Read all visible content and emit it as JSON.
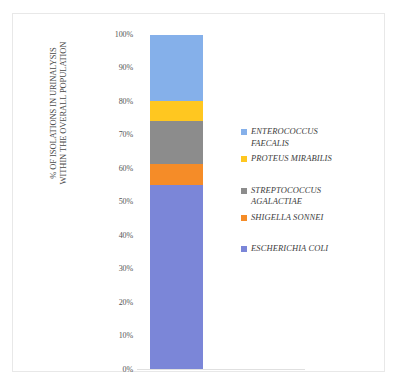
{
  "chart_data": {
    "type": "bar",
    "subtype": "stacked-100-percent",
    "title": "",
    "xlabel": "",
    "ylabel": "% OF ISOLATIONS IN URINALYSIS WITHIN THE OVERALL POPULATION",
    "ylabel_lines": [
      "% OF ISOLATIONS IN URINALYSIS",
      "WITHIN THE OVERALL POPULATION"
    ],
    "categories": [
      ""
    ],
    "ylim": [
      0,
      100
    ],
    "ytick_labels": [
      "100%",
      "90%",
      "80%",
      "70%",
      "60%",
      "50%",
      "40%",
      "30%",
      "20%",
      "10%",
      "0%"
    ],
    "ytick_values": [
      100,
      90,
      80,
      70,
      60,
      50,
      40,
      30,
      20,
      10,
      0
    ],
    "ytick_suffix": "%",
    "grid": false,
    "legend_position": "right",
    "series": [
      {
        "name": "ESCHERICHIA COLI",
        "values": [
          55.1
        ],
        "color": "#7b86d8",
        "start": 0.0,
        "end": 55.1
      },
      {
        "name": "SHIGELLA SONNEI",
        "values": [
          6.3
        ],
        "color": "#f58c28",
        "start": 55.1,
        "end": 61.4
      },
      {
        "name": "STREPTOCOCCUS AGALACTIAE",
        "values": [
          12.9
        ],
        "color": "#8c8c8c",
        "start": 61.4,
        "end": 74.3
      },
      {
        "name": "PROTEUS MIRABILIS",
        "values": [
          5.9
        ],
        "color": "#ffc720",
        "start": 74.3,
        "end": 80.2
      },
      {
        "name": "ENTEROCOCCUS FAECALIS",
        "values": [
          19.8
        ],
        "color": "#85b0ea",
        "start": 80.2,
        "end": 100.0
      }
    ],
    "legend_entries": [
      {
        "label": "ENTEROCOCCUS\nFAECALIS",
        "color": "#85b0ea",
        "name": "enterococcus-faecalis"
      },
      {
        "label": "PROTEUS MIRABILIS",
        "color": "#ffc720",
        "name": "proteus-mirabilis"
      },
      {
        "label": "STREPTOCOCCUS\nAGALACTIAE",
        "color": "#8c8c8c",
        "name": "streptococcus-agalactiae"
      },
      {
        "label": "SHIGELLA SONNEI",
        "color": "#f58c28",
        "name": "shigella-sonnei"
      },
      {
        "label": "ESCHERICHIA COLI",
        "color": "#7b86d8",
        "name": "escherichia-coli"
      }
    ]
  }
}
